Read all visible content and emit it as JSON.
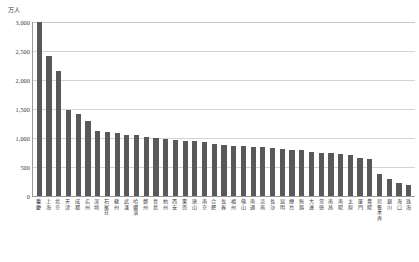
{
  "chart_data": {
    "type": "bar",
    "title": "",
    "subtitle": "",
    "xlabel": "",
    "ylabel": "万人",
    "unit_caption": "万人",
    "ylim": [
      0,
      3000
    ],
    "ytick_values": [
      3000,
      2500,
      2000,
      1500,
      1000,
      500,
      0
    ],
    "ytick_labels": [
      "3,000",
      "2,500",
      "2,000",
      "1,500",
      "1,000",
      "500",
      "0"
    ],
    "grid": true,
    "legend": false,
    "legend_position": "none",
    "bar_color": "#595959",
    "gridline_color": "#d4d4d4",
    "axis_color": "#9a9a9a",
    "categories": [
      "重慶",
      "上海",
      "北京",
      "天津",
      "成都",
      "広州",
      "深圳",
      "石家荘",
      "蘇州",
      "武漢",
      "哈爾濱",
      "鄭州",
      "青島",
      "杭州",
      "西安",
      "東莞",
      "唐山",
      "南京",
      "合肥",
      "長春",
      "福州",
      "佛山",
      "南通",
      "済南",
      "長沙",
      "昆明",
      "煙台",
      "無錫",
      "大連",
      "常徳",
      "南昌",
      "南陽",
      "太原",
      "厦門",
      "貴陽",
      "烏魯木斉",
      "銀川",
      "海口",
      "珠海"
    ],
    "values": [
      3000,
      2420,
      2150,
      1490,
      1420,
      1290,
      1120,
      1110,
      1090,
      1060,
      1050,
      1020,
      1000,
      990,
      960,
      950,
      940,
      930,
      900,
      880,
      870,
      860,
      850,
      840,
      820,
      810,
      800,
      790,
      760,
      750,
      740,
      730,
      700,
      650,
      640,
      380,
      290,
      220,
      190
    ]
  }
}
